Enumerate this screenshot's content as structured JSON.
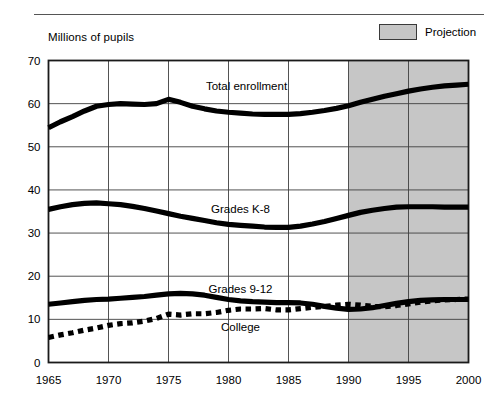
{
  "header": {
    "rule": "horizontal-rule"
  },
  "legend": {
    "label": "Projection",
    "swatch_color": "#c6c6c6",
    "swatch_border": "#3a3a3a"
  },
  "chart_data": {
    "type": "line",
    "title": "",
    "subtitle": "",
    "ylabel": "Millions of pupils",
    "xlabel": "",
    "xlim": [
      1965,
      2000
    ],
    "ylim": [
      0,
      70
    ],
    "ytick_values": [
      0,
      10,
      20,
      30,
      40,
      50,
      60,
      70
    ],
    "ytick_labels": [
      "0",
      "10",
      "20",
      "30",
      "40",
      "50",
      "60",
      "70"
    ],
    "xtick_values": [
      1965,
      1970,
      1975,
      1980,
      1985,
      1990,
      1995,
      2000
    ],
    "xtick_labels": [
      "1965",
      "1970",
      "1975",
      "1980",
      "1985",
      "1990",
      "1995",
      "2000"
    ],
    "grid": true,
    "legend_position": "top-right",
    "projection_start": 1990,
    "projection_end": 2000,
    "annotations": [
      {
        "text": "Total enrollment",
        "x": 1981.5,
        "y": 64.0
      },
      {
        "text": "Grades K-8",
        "x": 1981.0,
        "y": 35.5
      },
      {
        "text": "Grades 9-12",
        "x": 1981.0,
        "y": 17.0
      },
      {
        "text": "College",
        "x": 1981.0,
        "y": 8.3
      }
    ],
    "x": [
      1965,
      1966,
      1967,
      1968,
      1969,
      1970,
      1971,
      1972,
      1973,
      1974,
      1975,
      1976,
      1977,
      1978,
      1979,
      1980,
      1981,
      1982,
      1983,
      1984,
      1985,
      1986,
      1987,
      1988,
      1989,
      1990,
      1991,
      1992,
      1993,
      1994,
      1995,
      1996,
      1997,
      1998,
      1999,
      2000
    ],
    "series": [
      {
        "name": "Total enrollment",
        "style": "solid",
        "color": "#000000",
        "values": [
          54.4,
          55.8,
          57.0,
          58.3,
          59.4,
          59.8,
          60.0,
          59.9,
          59.8,
          60.0,
          61.0,
          60.3,
          59.4,
          58.8,
          58.3,
          58.0,
          57.8,
          57.6,
          57.5,
          57.5,
          57.5,
          57.7,
          58.0,
          58.4,
          58.9,
          59.5,
          60.3,
          61.0,
          61.7,
          62.3,
          62.9,
          63.4,
          63.8,
          64.1,
          64.3,
          64.5
        ]
      },
      {
        "name": "Grades K-8",
        "style": "solid",
        "color": "#000000",
        "values": [
          35.5,
          36.1,
          36.6,
          36.9,
          37.0,
          36.8,
          36.6,
          36.2,
          35.7,
          35.1,
          34.5,
          33.9,
          33.4,
          32.9,
          32.4,
          32.0,
          31.8,
          31.6,
          31.4,
          31.3,
          31.3,
          31.6,
          32.1,
          32.7,
          33.4,
          34.1,
          34.8,
          35.3,
          35.7,
          36.0,
          36.1,
          36.1,
          36.1,
          36.0,
          36.0,
          36.0
        ]
      },
      {
        "name": "Grades 9-12",
        "style": "solid",
        "color": "#000000",
        "values": [
          13.5,
          13.8,
          14.1,
          14.4,
          14.6,
          14.7,
          14.9,
          15.1,
          15.3,
          15.6,
          15.9,
          16.0,
          15.9,
          15.6,
          15.1,
          14.6,
          14.3,
          14.1,
          14.0,
          13.9,
          13.9,
          13.8,
          13.5,
          13.0,
          12.6,
          12.3,
          12.4,
          12.7,
          13.2,
          13.7,
          14.1,
          14.4,
          14.5,
          14.6,
          14.6,
          14.6
        ]
      },
      {
        "name": "College",
        "style": "dashed",
        "color": "#000000",
        "values": [
          5.8,
          6.4,
          6.9,
          7.5,
          8.0,
          8.6,
          9.0,
          9.2,
          9.6,
          10.2,
          11.2,
          11.0,
          11.3,
          11.3,
          11.6,
          12.1,
          12.4,
          12.4,
          12.5,
          12.2,
          12.2,
          12.5,
          12.8,
          13.0,
          13.3,
          13.5,
          13.3,
          13.0,
          12.9,
          13.2,
          13.6,
          14.0,
          14.3,
          14.5,
          14.6,
          14.7
        ]
      }
    ]
  }
}
